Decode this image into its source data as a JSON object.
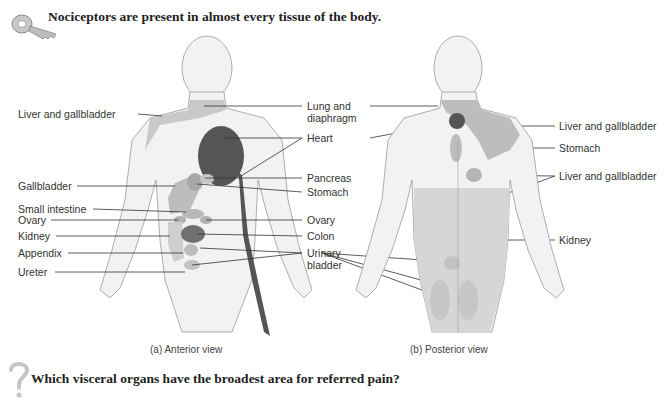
{
  "header": {
    "text": "Nociceptors are present in almost every tissue of the body."
  },
  "question": {
    "text": "Which visceral organs have the broadest area for referred pain?"
  },
  "icons": {
    "key": "key-icon",
    "question": "question-mark-icon"
  },
  "colors": {
    "light_region": "#d0d0d0",
    "medium_region": "#b3b3b3",
    "dark_region": "#555555",
    "body": "#f2f2f2",
    "outline": "#9a9a9a",
    "leader": "#333333"
  },
  "anterior": {
    "caption": "(a) Anterior view",
    "left_labels": [
      "Liver and gallbladder",
      "Gallbladder",
      "Small intestine",
      "Ovary",
      "Kidney",
      "Appendix",
      "Ureter"
    ],
    "right_labels": [
      "Lung and",
      "diaphragm",
      "Heart",
      "Pancreas",
      "Stomach",
      "Ovary",
      "Colon",
      "Urinary",
      "bladder"
    ]
  },
  "posterior": {
    "caption": "(b) Posterior view",
    "right_labels": [
      "Liver and gallbladder",
      "Stomach",
      "Liver and gallbladder",
      "Kidney"
    ]
  }
}
